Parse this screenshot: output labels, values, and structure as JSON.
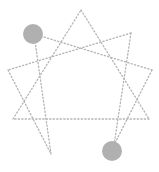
{
  "diagram": {
    "type": "enneagram-figure",
    "nodes": [
      {
        "id": "top"
      },
      {
        "id": "upper-right"
      },
      {
        "id": "right"
      },
      {
        "id": "lower-right"
      },
      {
        "id": "bottom-right"
      },
      {
        "id": "bottom-left"
      },
      {
        "id": "lower-left"
      },
      {
        "id": "left"
      },
      {
        "id": "upper-left"
      }
    ],
    "edges": [
      [
        "top",
        "lower-right"
      ],
      [
        "lower-right",
        "lower-left"
      ],
      [
        "lower-left",
        "top"
      ],
      [
        "upper-left",
        "right"
      ],
      [
        "right",
        "bottom-right"
      ],
      [
        "bottom-right",
        "upper-right"
      ],
      [
        "upper-right",
        "left"
      ],
      [
        "left",
        "bottom-left"
      ],
      [
        "bottom-left",
        "upper-left"
      ]
    ],
    "highlighted_nodes": [
      "upper-left",
      "bottom-right"
    ],
    "colors": {
      "edge": "#b4b4b4",
      "highlight": "#b0b0b0",
      "background": "#ffffff"
    }
  }
}
